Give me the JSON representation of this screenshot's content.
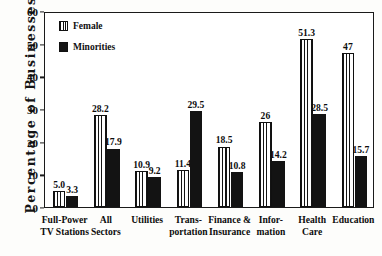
{
  "chart_data": {
    "type": "bar",
    "title": "",
    "xlabel": "",
    "ylabel": "Percentage of Businesses",
    "ylim": [
      0,
      60
    ],
    "yticks": [
      0,
      10,
      20,
      30,
      40,
      50,
      60
    ],
    "grid": false,
    "legend_position": "top-left",
    "categories": [
      "Full-Power TV Stations",
      "All Sectors",
      "Utilities",
      "Transportation",
      "Finance & Insurance",
      "Information",
      "Health Care",
      "Education"
    ],
    "category_lines": [
      [
        "Full-Power",
        "TV Stations"
      ],
      [
        "All",
        "Sectors"
      ],
      [
        "Utilities"
      ],
      [
        "Trans-",
        "portation"
      ],
      [
        "Finance &",
        "Insurance"
      ],
      [
        "Infor-",
        "mation"
      ],
      [
        "Health",
        "Care"
      ],
      [
        "Education"
      ]
    ],
    "series": [
      {
        "name": "Female",
        "values": [
          5.0,
          28.2,
          10.9,
          11.4,
          18.5,
          26,
          51.3,
          47
        ],
        "labels": [
          "5.0",
          "28.2",
          "10.9",
          "11.4",
          "18.5",
          "26",
          "51.3",
          "47"
        ],
        "fill": "vertical-stripes",
        "color": "#ffffff",
        "edge_color": "#101010"
      },
      {
        "name": "Minorities",
        "values": [
          3.3,
          17.9,
          9.2,
          29.5,
          10.8,
          14.2,
          28.5,
          15.7
        ],
        "labels": [
          "3.3",
          "17.9",
          "9.2",
          "29.5",
          "10.8",
          "14.2",
          "28.5",
          "15.7"
        ],
        "fill": "solid",
        "color": "#131313",
        "edge_color": "#131313"
      }
    ]
  },
  "legend": {
    "items": [
      {
        "label": "Female",
        "swatch": "vertical-stripes-swatch"
      },
      {
        "label": "Minorities",
        "swatch": "solid-black-swatch"
      }
    ]
  },
  "axes": {
    "y_title": "Percentage of Businesses",
    "y_tick_labels": [
      "60",
      "50",
      "40",
      "30",
      "20",
      "10",
      "0"
    ]
  },
  "colors": {
    "background": "#fdfdfb",
    "plot_background": "#ffffff",
    "axis": "#1a1a1a",
    "text": "#101010",
    "minorities_fill": "#131313",
    "female_fill": "#ffffff"
  }
}
